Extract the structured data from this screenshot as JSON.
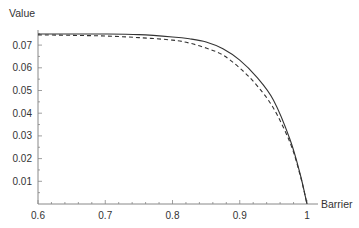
{
  "chart_data": {
    "type": "line",
    "title": "",
    "xlabel": "Barrier",
    "ylabel": "Value",
    "xlim": [
      0.6,
      1.0
    ],
    "ylim": [
      0,
      0.077
    ],
    "grid": false,
    "legend": null,
    "x_ticks": [
      "0.6",
      "0.7",
      "0.8",
      "0.9",
      "1"
    ],
    "y_ticks": [
      "0.01",
      "0.02",
      "0.03",
      "0.04",
      "0.05",
      "0.06",
      "0.07"
    ],
    "x": [
      0.6,
      0.65,
      0.7,
      0.75,
      0.8,
      0.825,
      0.85,
      0.875,
      0.9,
      0.925,
      0.95,
      0.975,
      0.99,
      1.0
    ],
    "series": [
      {
        "name": "solid",
        "style": "solid",
        "color": "#333333",
        "values": [
          0.0749,
          0.0749,
          0.0749,
          0.0746,
          0.0736,
          0.0728,
          0.0714,
          0.0684,
          0.0634,
          0.056,
          0.0458,
          0.0282,
          0.013,
          0.0
        ]
      },
      {
        "name": "dashed",
        "style": "dashed",
        "color": "#333333",
        "values": [
          0.0745,
          0.0743,
          0.074,
          0.0733,
          0.0722,
          0.0709,
          0.0687,
          0.0656,
          0.0599,
          0.0524,
          0.0423,
          0.0269,
          0.0125,
          0.0
        ]
      }
    ]
  }
}
